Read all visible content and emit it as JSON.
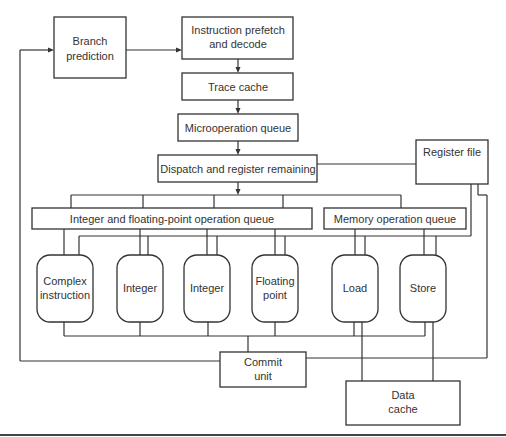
{
  "diagram": {
    "type": "block-diagram",
    "colors": {
      "stroke": "#333333",
      "background": "#ffffff",
      "text": "#333333"
    },
    "nodes": {
      "branch_prediction": {
        "line1": "Branch",
        "line2": "prediction"
      },
      "instruction_prefetch": {
        "line1": "Instruction prefetch",
        "line2": "and decode"
      },
      "trace_cache": {
        "label": "Trace cache"
      },
      "microoperation_queue": {
        "label": "Microoperation queue"
      },
      "dispatch": {
        "label": "Dispatch and register remaining"
      },
      "register_file": {
        "label": "Register file"
      },
      "int_fp_queue": {
        "label": "Integer and floating-point operation queue"
      },
      "memory_queue": {
        "label": "Memory operation queue"
      },
      "complex_instruction": {
        "line1": "Complex",
        "line2": "instruction"
      },
      "integer_1": {
        "label": "Integer"
      },
      "integer_2": {
        "label": "Integer"
      },
      "floating_point": {
        "line1": "Floating",
        "line2": "point"
      },
      "load": {
        "label": "Load"
      },
      "store": {
        "label": "Store"
      },
      "commit_unit": {
        "line1": "Commit",
        "line2": "unit"
      },
      "data_cache": {
        "line1": "Data",
        "line2": "cache"
      }
    },
    "edges": [
      {
        "from": "Branch prediction",
        "to": "Instruction prefetch and decode",
        "arrow": true
      },
      {
        "from": "Instruction prefetch and decode",
        "to": "Trace cache",
        "arrow": true
      },
      {
        "from": "Trace cache",
        "to": "Microoperation queue",
        "arrow": true
      },
      {
        "from": "Microoperation queue",
        "to": "Dispatch and register remaining",
        "arrow": true
      },
      {
        "from": "Dispatch and register remaining",
        "to": "Register file",
        "arrow": false
      },
      {
        "from": "Dispatch and register remaining",
        "to": "Integer and floating-point operation queue",
        "arrow": false
      },
      {
        "from": "Dispatch and register remaining",
        "to": "Memory operation queue",
        "arrow": false
      },
      {
        "from": "Integer and floating-point operation queue",
        "to": "Execution units",
        "arrow": false
      },
      {
        "from": "Memory operation queue",
        "to": "Load / Store",
        "arrow": false
      },
      {
        "from": "Register file",
        "to": "Execution units",
        "arrow": false
      },
      {
        "from": "Execution units",
        "to": "Commit unit",
        "arrow": false
      },
      {
        "from": "Load / Store",
        "to": "Data cache",
        "arrow": false
      },
      {
        "from": "Commit unit",
        "to": "Branch prediction",
        "arrow": true
      },
      {
        "from": "Commit unit",
        "to": "Register file",
        "arrow": false
      }
    ]
  }
}
